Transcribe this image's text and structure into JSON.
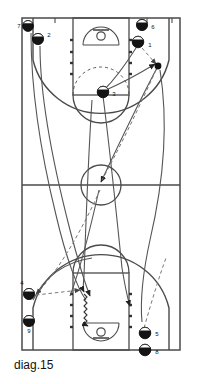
{
  "diagram": {
    "caption": "diag.15",
    "type": "basketball-play-diagram",
    "sport": "basketball",
    "view": "full-court",
    "colors": {
      "court_line": "#4a4a4a",
      "player_marker": "#111111",
      "movement_line": "#555555",
      "pass_line": "#777777",
      "background": "#ffffff"
    },
    "court": {
      "left": 22,
      "right": 180,
      "top": 18,
      "bottom": 350,
      "halfcourt_y": 185,
      "center_circle_r": 20
    },
    "players": [
      {
        "id": "p7",
        "label": "7",
        "x": 28,
        "y": 26,
        "label_dx": -9,
        "label_dy": 2
      },
      {
        "id": "p2",
        "label": "2",
        "x": 38,
        "y": 39,
        "label_dx": 10,
        "label_dy": -3
      },
      {
        "id": "p6",
        "label": "6",
        "x": 142,
        "y": 25,
        "label_dx": 10,
        "label_dy": 3
      },
      {
        "id": "p1",
        "label": "1",
        "x": 138,
        "y": 42,
        "label_dx": 11,
        "label_dy": 4
      },
      {
        "id": "p3",
        "label": "3",
        "x": 103,
        "y": 92,
        "label_dx": 10,
        "label_dy": 3
      },
      {
        "id": "p4",
        "label": "4",
        "x": 29,
        "y": 294,
        "label_dx": -8,
        "label_dy": -8
      },
      {
        "id": "p9",
        "label": "9",
        "x": 29,
        "y": 321,
        "label_dx": 0,
        "label_dy": 11
      },
      {
        "id": "p5",
        "label": "5",
        "x": 145,
        "y": 333,
        "label_dx": 10,
        "label_dy": 1
      },
      {
        "id": "p8",
        "label": "8",
        "x": 145,
        "y": 350,
        "label_dx": 10,
        "label_dy": 2
      }
    ],
    "labels": {
      "p7": "7",
      "p2": "2",
      "p6": "6",
      "p1": "1",
      "p3": "3",
      "p4": "4",
      "p9": "9",
      "p5": "5",
      "p8": "8"
    }
  }
}
